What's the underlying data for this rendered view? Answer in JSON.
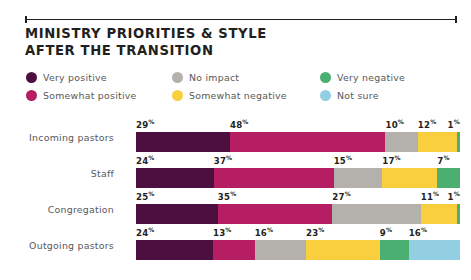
{
  "title": {
    "line1": "MINISTRY PRIORITIES & STYLE",
    "line2": "AFTER THE TRANSITION"
  },
  "legend": {
    "items": [
      {
        "label": "Very positive",
        "color": "#4c0f3f",
        "icon": "legend-dot-icon"
      },
      {
        "label": "No impact",
        "color": "#b4b1ac",
        "icon": "legend-dot-icon"
      },
      {
        "label": "Very negative",
        "color": "#4caf72",
        "icon": "legend-dot-icon"
      },
      {
        "label": "Somewhat positive",
        "color": "#b51e62",
        "icon": "legend-dot-icon"
      },
      {
        "label": "Somewhat negative",
        "color": "#f9cf3e",
        "icon": "legend-dot-icon"
      },
      {
        "label": "Not sure",
        "color": "#92cfe3",
        "icon": "legend-dot-icon"
      }
    ]
  },
  "chart_data": {
    "type": "bar",
    "subtype": "stacked-horizontal-100pct",
    "title": "MINISTRY PRIORITIES & STYLE AFTER THE TRANSITION",
    "xlabel": "",
    "ylabel": "",
    "xlim": [
      0,
      100
    ],
    "grid": false,
    "legend_position": "top",
    "value_suffix": "%",
    "categories": [
      "Incoming pastors",
      "Staff",
      "Congregation",
      "Outgoing pastors"
    ],
    "series": [
      {
        "name": "Very positive",
        "color": "#4c0f3f",
        "values": [
          29,
          24,
          25,
          24
        ]
      },
      {
        "name": "Somewhat positive",
        "color": "#b51e62",
        "values": [
          48,
          37,
          35,
          13
        ]
      },
      {
        "name": "No impact",
        "color": "#b4b1ac",
        "values": [
          10,
          15,
          27,
          16
        ]
      },
      {
        "name": "Somewhat negative",
        "color": "#f9cf3e",
        "values": [
          12,
          17,
          11,
          23
        ]
      },
      {
        "name": "Very negative",
        "color": "#4caf72",
        "values": [
          1,
          7,
          1,
          9
        ]
      },
      {
        "name": "Not sure",
        "color": "#92cfe3",
        "values": [
          null,
          null,
          null,
          16
        ]
      }
    ],
    "rows": [
      {
        "label": "Incoming pastors",
        "segments": [
          {
            "name": "Very positive",
            "value": 29,
            "text": "29",
            "suffix": "%",
            "color": "#4c0f3f",
            "align": "left"
          },
          {
            "name": "Somewhat positive",
            "value": 48,
            "text": "48",
            "suffix": "%",
            "color": "#b51e62",
            "align": "left"
          },
          {
            "name": "No impact",
            "value": 10,
            "text": "10",
            "suffix": "%",
            "color": "#b4b1ac",
            "align": "left"
          },
          {
            "name": "Somewhat negative",
            "value": 12,
            "text": "12",
            "suffix": "%",
            "color": "#f9cf3e",
            "align": "left"
          },
          {
            "name": "Very negative",
            "value": 1,
            "text": "1",
            "suffix": "%",
            "color": "#4caf72",
            "align": "right"
          }
        ]
      },
      {
        "label": "Staff",
        "segments": [
          {
            "name": "Very positive",
            "value": 24,
            "text": "24",
            "suffix": "%",
            "color": "#4c0f3f",
            "align": "left"
          },
          {
            "name": "Somewhat positive",
            "value": 37,
            "text": "37",
            "suffix": "%",
            "color": "#b51e62",
            "align": "left"
          },
          {
            "name": "No impact",
            "value": 15,
            "text": "15",
            "suffix": "%",
            "color": "#b4b1ac",
            "align": "left"
          },
          {
            "name": "Somewhat negative",
            "value": 17,
            "text": "17",
            "suffix": "%",
            "color": "#f9cf3e",
            "align": "left"
          },
          {
            "name": "Very negative",
            "value": 7,
            "text": "7",
            "suffix": "%",
            "color": "#4caf72",
            "align": "left"
          }
        ]
      },
      {
        "label": "Congregation",
        "segments": [
          {
            "name": "Very positive",
            "value": 25,
            "text": "25",
            "suffix": "%",
            "color": "#4c0f3f",
            "align": "left"
          },
          {
            "name": "Somewhat positive",
            "value": 35,
            "text": "35",
            "suffix": "%",
            "color": "#b51e62",
            "align": "left"
          },
          {
            "name": "No impact",
            "value": 27,
            "text": "27",
            "suffix": "%",
            "color": "#b4b1ac",
            "align": "left"
          },
          {
            "name": "Somewhat negative",
            "value": 11,
            "text": "11",
            "suffix": "%",
            "color": "#f9cf3e",
            "align": "left"
          },
          {
            "name": "Very negative",
            "value": 1,
            "text": "1",
            "suffix": "%",
            "color": "#4caf72",
            "align": "right"
          }
        ]
      },
      {
        "label": "Outgoing pastors",
        "segments": [
          {
            "name": "Very positive",
            "value": 24,
            "text": "24",
            "suffix": "%",
            "color": "#4c0f3f",
            "align": "left"
          },
          {
            "name": "Somewhat positive",
            "value": 13,
            "text": "13",
            "suffix": "%",
            "color": "#b51e62",
            "align": "left"
          },
          {
            "name": "No impact",
            "value": 16,
            "text": "16",
            "suffix": "%",
            "color": "#b4b1ac",
            "align": "left"
          },
          {
            "name": "Somewhat negative",
            "value": 23,
            "text": "23",
            "suffix": "%",
            "color": "#f9cf3e",
            "align": "left"
          },
          {
            "name": "Very negative",
            "value": 9,
            "text": "9",
            "suffix": "%",
            "color": "#4caf72",
            "align": "left"
          },
          {
            "name": "Not sure",
            "value": 16,
            "text": "16",
            "suffix": "%",
            "color": "#92cfe3",
            "align": "left"
          }
        ]
      }
    ]
  }
}
